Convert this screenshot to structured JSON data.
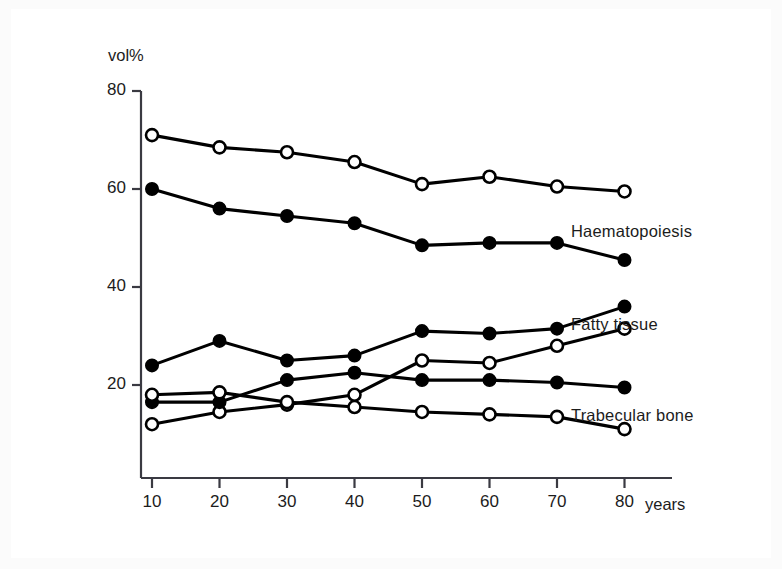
{
  "chart_data": {
    "type": "line",
    "title": "",
    "xlabel": "years",
    "ylabel": "vol%",
    "x": [
      10,
      20,
      30,
      40,
      50,
      60,
      70,
      80
    ],
    "xticks": [
      "10",
      "20",
      "30",
      "40",
      "50",
      "60",
      "70",
      "80"
    ],
    "yticks": [
      "20",
      "40",
      "60",
      "80"
    ],
    "ytick_values": [
      20,
      40,
      60,
      80
    ],
    "xlim": [
      5,
      85
    ],
    "ylim": [
      5,
      80
    ],
    "grid": false,
    "legend_position": "right-inline",
    "series": [
      {
        "name": "Haematopoiesis (open)",
        "marker": "open-circle",
        "label": "Haematopoiesis",
        "label_for_pair": true,
        "values": [
          71,
          68.5,
          67.5,
          65.5,
          61,
          62.5,
          60.5,
          59.5
        ]
      },
      {
        "name": "Haematopoiesis (filled)",
        "marker": "filled-circle",
        "label": "",
        "label_for_pair": false,
        "values": [
          60,
          56,
          54.5,
          53,
          48.5,
          49,
          49,
          45.5
        ]
      },
      {
        "name": "Fatty tissue (filled)",
        "marker": "filled-circle",
        "label": "Fatty tissue",
        "label_for_pair": true,
        "values": [
          24,
          29,
          25,
          26,
          31,
          30.5,
          31.5,
          36
        ]
      },
      {
        "name": "Fatty tissue (open)",
        "marker": "open-circle",
        "label": "",
        "label_for_pair": false,
        "values": [
          12,
          14.5,
          16,
          18,
          25,
          24.5,
          28,
          31.5
        ]
      },
      {
        "name": "Trabecular bone (filled)",
        "marker": "filled-circle",
        "label": "Trabecular bone",
        "label_for_pair": true,
        "values": [
          16.5,
          16.5,
          21,
          22.5,
          21,
          21,
          20.5,
          19.5
        ]
      },
      {
        "name": "Trabecular bone (open)",
        "marker": "open-circle",
        "label": "",
        "label_for_pair": false,
        "values": [
          18,
          18.5,
          16.5,
          15.5,
          14.5,
          14,
          13.5,
          11
        ]
      }
    ],
    "annotations": [
      {
        "text": "Haematopoiesis",
        "x": 571,
        "y": 222
      },
      {
        "text": "Fatty tissue",
        "x": 571,
        "y": 315
      },
      {
        "text": "Trabecular bone",
        "x": 571,
        "y": 406
      }
    ],
    "colors": {
      "line": "#000000",
      "marker_fill": "#000000",
      "marker_open_fill": "#ffffff",
      "axis": "#3a3a42",
      "text": "#1c1c1c",
      "frame": "#3a3a42",
      "page_background": "#ffffff",
      "outer_background": "#fbfbfb"
    }
  },
  "axis": {
    "y_unit": "vol%",
    "x_unit": "years"
  }
}
